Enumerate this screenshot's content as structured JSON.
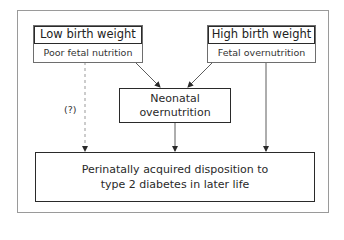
{
  "diagram": {
    "left_box": {
      "title": "Low birth weight",
      "subtitle": "Poor fetal nutrition"
    },
    "right_box": {
      "title": "High birth weight",
      "subtitle": "Fetal overnutrition"
    },
    "middle_box": {
      "line1": "Neonatal",
      "line2": "overnutrition"
    },
    "bottom_box": {
      "line1": "Perinatally acquired disposition to",
      "line2": "type 2 diabetes in later life"
    },
    "uncertain_label": "(?)",
    "edges": [
      {
        "from": "left_box",
        "to": "middle_box",
        "style": "solid"
      },
      {
        "from": "right_box",
        "to": "middle_box",
        "style": "solid"
      },
      {
        "from": "left_box",
        "to": "bottom_box",
        "style": "dashed",
        "label": "(?)"
      },
      {
        "from": "middle_box",
        "to": "bottom_box",
        "style": "solid"
      },
      {
        "from": "right_box",
        "to": "bottom_box",
        "style": "solid"
      }
    ],
    "colors": {
      "box_border": "#2a2a2a",
      "frame_border": "#9a9a9a",
      "dashed_line": "#9a9a9a",
      "text": "#222222"
    }
  }
}
